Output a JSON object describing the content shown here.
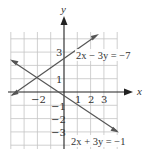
{
  "figure": {
    "axes": {
      "x_label": "x",
      "y_label": "y"
    },
    "x_ticks": [
      {
        "value": -2,
        "label": "−2"
      },
      {
        "value": 1,
        "label": "1"
      },
      {
        "value": 2,
        "label": "2"
      },
      {
        "value": 3,
        "label": "3"
      }
    ],
    "y_ticks": [
      {
        "value": 3,
        "label": "3"
      },
      {
        "value": 1,
        "label": "1"
      },
      {
        "value": -1,
        "label": "−1"
      },
      {
        "value": -2,
        "label": "−2"
      },
      {
        "value": -3,
        "label": "−3"
      }
    ],
    "lines": [
      {
        "equation": "2x − 3y = −7",
        "slope": 0.6667,
        "intercept": 2.3333,
        "color": "#555555"
      },
      {
        "equation": "2x + 3y = −1",
        "slope": -0.6667,
        "intercept": -0.3333,
        "color": "#555555"
      }
    ],
    "intersection": {
      "x": -2,
      "y": 1
    },
    "grid": {
      "x_range": [
        -4,
        4
      ],
      "y_range": [
        -4,
        4
      ],
      "step": 1,
      "color": "#bbbbbb"
    }
  }
}
